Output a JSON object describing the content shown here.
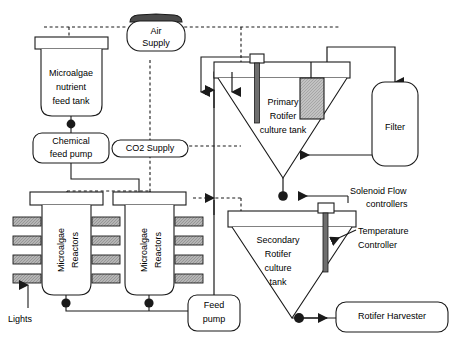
{
  "diagram": {
    "type": "process-flow-diagram",
    "colors": {
      "line": "#1a1a1a",
      "fill_white": "#ffffff",
      "fill_gray": "#a8a8a8",
      "fill_dark": "#555555",
      "background": "#ffffff"
    },
    "nodes": {
      "air_supply": {
        "label_line1": "Air",
        "label_line2": "Supply",
        "shape": "rounded-capsule"
      },
      "co2_supply": {
        "label": "CO2 Supply",
        "shape": "rounded-capsule"
      },
      "nutrient_tank": {
        "label_line1": "Microalgae",
        "label_line2": "nutrient",
        "label_line3": "feed tank",
        "shape": "vessel"
      },
      "chemical_pump": {
        "label_line1": "Chemical",
        "label_line2": "feed pump",
        "shape": "rounded-rect"
      },
      "reactor_left": {
        "label_line1": "Microalgae",
        "label_line2": "Reactors",
        "shape": "vessel",
        "orientation": "vertical-text"
      },
      "reactor_right": {
        "label_line1": "Microalgae",
        "label_line2": "Reactors",
        "shape": "vessel",
        "orientation": "vertical-text"
      },
      "lights": {
        "label": "Lights",
        "shape": "arrow-annotation"
      },
      "feed_pump": {
        "label_line1": "Feed",
        "label_line2": "pump",
        "shape": "rounded-rect"
      },
      "primary_tank": {
        "label_line1": "Primary",
        "label_line2": "Rotifer",
        "label_line3": "culture tank",
        "shape": "inverted-cone"
      },
      "secondary_tank": {
        "label_line1": "Secondary",
        "label_line2": "Rotifer",
        "label_line3": "culture",
        "label_line4": "tank",
        "shape": "inverted-cone"
      },
      "filter": {
        "label": "Filter",
        "shape": "rounded-rect"
      },
      "rotifer_harvester": {
        "label": "Rotifer Harvester",
        "shape": "rounded-rect"
      },
      "solenoid_controllers": {
        "label_line1": "Solenoid Flow",
        "label_line2": "controllers",
        "shape": "annotation"
      },
      "temperature_controller": {
        "label_line1": "Temperature",
        "label_line2": "Controller",
        "shape": "annotation"
      }
    },
    "legend": {
      "solid_line": "liquid / slurry flow piping",
      "dashed_line": "gas supply line (air / CO2)"
    }
  }
}
